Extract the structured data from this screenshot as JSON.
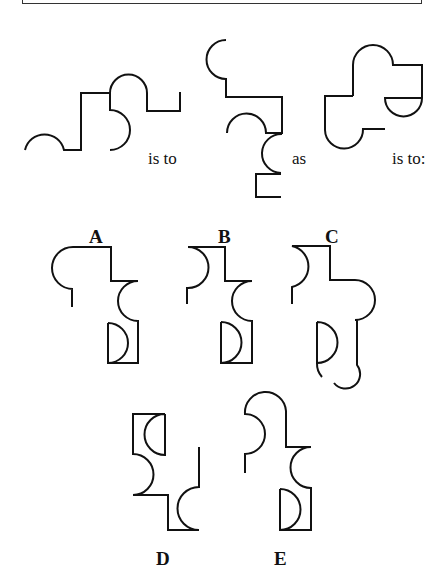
{
  "puzzle": {
    "type": "figure-analogy",
    "connectors": {
      "first": "is to",
      "second": "as",
      "third": "is to:"
    },
    "options": [
      {
        "label": "A"
      },
      {
        "label": "B"
      },
      {
        "label": "C"
      },
      {
        "label": "D"
      },
      {
        "label": "E"
      }
    ]
  },
  "colors": {
    "stroke": "#111111",
    "background": "#ffffff"
  }
}
